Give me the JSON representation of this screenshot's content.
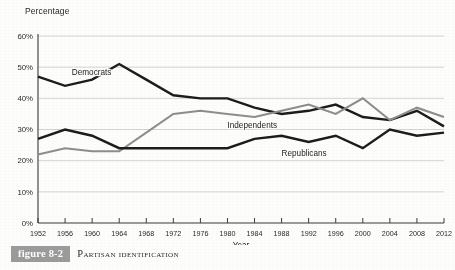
{
  "figure": {
    "number_label": "figure 8-2",
    "caption": "Partisan Identification"
  },
  "colors": {
    "democrats": "#1c1c1c",
    "republicans": "#1c1c1c",
    "independents": "#8d8d8d",
    "gridline": "#c9c9c9",
    "axis": "#3a3a3a",
    "caption_box": "#9b9b9b",
    "caption_text": "#ffffff",
    "background": "#fdfdfc"
  },
  "chart_data": {
    "type": "line",
    "title": "Partisan Identification",
    "xlabel": "Year",
    "ylabel": "Percentage",
    "xlim": [
      1952,
      2012
    ],
    "ylim": [
      0,
      60
    ],
    "yticks": [
      0,
      10,
      20,
      30,
      40,
      50,
      60
    ],
    "ytick_labels": [
      "0%",
      "10%",
      "20%",
      "30%",
      "40%",
      "50%",
      "60%"
    ],
    "grid": true,
    "legend": "inline-labels",
    "x": [
      1952,
      1956,
      1960,
      1964,
      1968,
      1972,
      1976,
      1980,
      1984,
      1988,
      1992,
      1996,
      2000,
      2004,
      2008,
      2012
    ],
    "xtick_labels": [
      "1952",
      "1956",
      "1960",
      "1964",
      "1968",
      "1972",
      "1976",
      "1980",
      "1984",
      "1988",
      "1992",
      "1996",
      "2000",
      "2004",
      "2008",
      "2012"
    ],
    "series": [
      {
        "name": "Democrats",
        "color": "#1c1c1c",
        "label_x": 1957,
        "label_y": 47.5,
        "values": [
          47,
          44,
          46,
          51,
          46,
          41,
          40,
          40,
          37,
          35,
          36,
          38,
          34,
          33,
          36,
          31
        ]
      },
      {
        "name": "Independents",
        "color": "#8d8d8d",
        "label_x": 1980,
        "label_y": 30.5,
        "values": [
          22,
          24,
          23,
          23,
          29,
          35,
          36,
          35,
          34,
          36,
          38,
          35,
          40,
          33,
          37,
          34
        ]
      },
      {
        "name": "Republicans",
        "color": "#1c1c1c",
        "label_x": 1988,
        "label_y": 21.5,
        "values": [
          27,
          30,
          28,
          24,
          24,
          24,
          24,
          24,
          27,
          28,
          26,
          28,
          24,
          30,
          28,
          29
        ]
      }
    ]
  }
}
